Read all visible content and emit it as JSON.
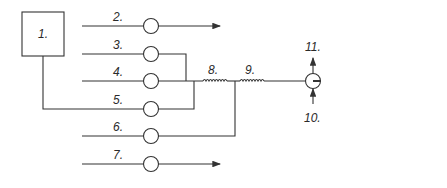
{
  "diagram": {
    "type": "schematic-block-diagram",
    "colors": {
      "stroke": "#333333",
      "background": "#ffffff",
      "text": "#2a2a2a"
    },
    "blocks": [
      {
        "id": "1",
        "label": "1."
      },
      {
        "id": "12",
        "label": "12."
      },
      {
        "id": "13",
        "label": "13."
      },
      {
        "id": "14",
        "label": "14."
      }
    ],
    "lines": [
      {
        "id": "2",
        "label": "2.",
        "ends": "arrow"
      },
      {
        "id": "3",
        "label": "3."
      },
      {
        "id": "4",
        "label": "4."
      },
      {
        "id": "5",
        "label": "5.",
        "from": "1"
      },
      {
        "id": "6",
        "label": "6."
      },
      {
        "id": "7",
        "label": "7.",
        "ends": "arrow"
      }
    ],
    "coils": [
      {
        "id": "8",
        "label": "8."
      },
      {
        "id": "9",
        "label": "9."
      }
    ],
    "junction": {
      "out_up": {
        "id": "11",
        "label": "11."
      },
      "in_down": {
        "id": "10",
        "label": "10."
      }
    },
    "output": {
      "id": "15",
      "label": "15."
    }
  }
}
